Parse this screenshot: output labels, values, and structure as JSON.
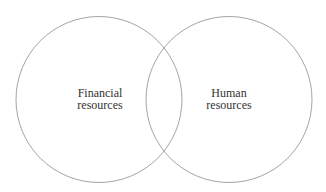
{
  "diagram": {
    "type": "venn",
    "stroke_color": "#9a9a9a",
    "text_color": "#333333",
    "background": "#ffffff",
    "circles": [
      {
        "id": "financial",
        "label_lines": [
          "Financial",
          "resources"
        ],
        "cx": 99,
        "cy": 99.5,
        "r": 83
      },
      {
        "id": "human",
        "label_lines": [
          "Human",
          "resources"
        ],
        "cx": 229,
        "cy": 99.5,
        "r": 83
      }
    ]
  }
}
